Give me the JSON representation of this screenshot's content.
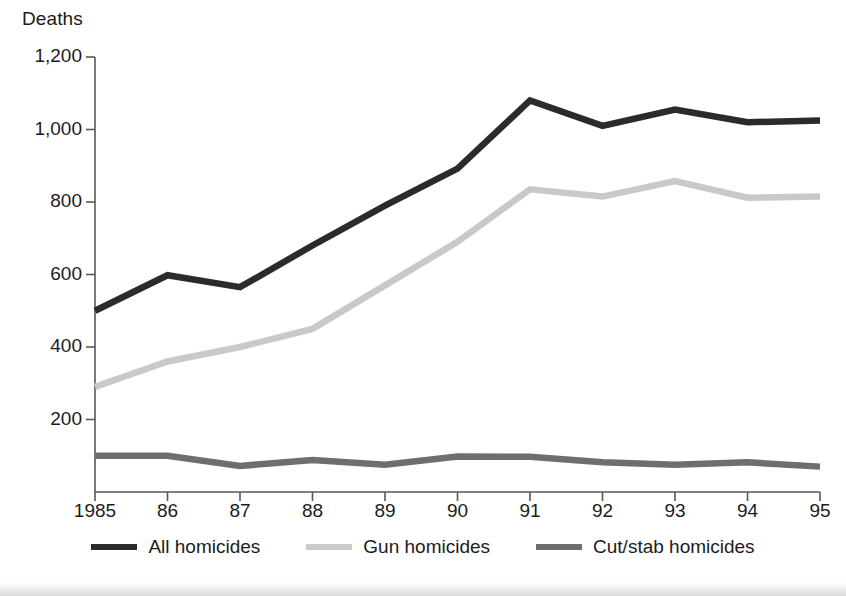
{
  "chart_data": {
    "type": "line",
    "title": "",
    "ylabel": "Deaths",
    "xlabel": "",
    "categories": [
      "1985",
      "86",
      "87",
      "88",
      "89",
      "90",
      "91",
      "92",
      "93",
      "94",
      "95"
    ],
    "x": [
      1985,
      1986,
      1987,
      1988,
      1989,
      1990,
      1991,
      1992,
      1993,
      1994,
      1995
    ],
    "ylim": [
      0,
      1200
    ],
    "xlim": [
      1985,
      1995
    ],
    "yticks": [
      200,
      400,
      600,
      800,
      1000,
      1200
    ],
    "ytick_labels": [
      "200",
      "400",
      "600",
      "800",
      "1,000",
      "1,200"
    ],
    "grid": false,
    "legend_position": "bottom",
    "series": [
      {
        "name": "All homicides",
        "color": "#2b2b2b",
        "values": [
          500,
          598,
          565,
          680,
          790,
          892,
          1080,
          1010,
          1055,
          1020,
          1025
        ]
      },
      {
        "name": "Gun homicides",
        "color": "#c9c9c9",
        "values": [
          290,
          360,
          400,
          450,
          570,
          690,
          835,
          815,
          858,
          812,
          815
        ]
      },
      {
        "name": "Cut/stab homicides",
        "color": "#6e6e6e",
        "values": [
          100,
          100,
          72,
          88,
          75,
          98,
          97,
          82,
          75,
          82,
          70
        ]
      }
    ]
  },
  "axis": {
    "y_title": "Deaths"
  },
  "legend": {
    "items": [
      {
        "label": "All homicides",
        "color": "#2b2b2b"
      },
      {
        "label": "Gun homicides",
        "color": "#c9c9c9"
      },
      {
        "label": "Cut/stab homicides",
        "color": "#6e6e6e"
      }
    ]
  },
  "colors": {
    "all_homicides": "#2b2b2b",
    "gun_homicides": "#c9c9c9",
    "cut_stab_homicides": "#6e6e6e",
    "axis": "#585858",
    "text": "#1c1c1c",
    "background": "#ffffff"
  }
}
